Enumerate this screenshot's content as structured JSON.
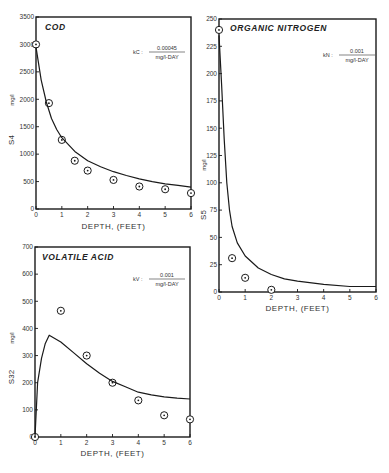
{
  "chart_data": [
    {
      "type": "line",
      "title": "COD",
      "xlabel": "DEPTH, (FEET)",
      "ylabel": "S4",
      "ylabel_units": "mg/l",
      "rate_constant": {
        "symbol": "kC",
        "numerator": "0.00045",
        "denominator": "mg/l-DAY"
      },
      "xlim": [
        0,
        6
      ],
      "ylim": [
        0,
        3500
      ],
      "xticks": [
        0,
        1,
        2,
        3,
        4,
        5,
        6
      ],
      "yticks": [
        0,
        500,
        1000,
        1500,
        2000,
        2500,
        3000,
        3500
      ],
      "grid": false,
      "series": [
        {
          "name": "observed",
          "kind": "scatter",
          "x": [
            0,
            0.5,
            1,
            1.5,
            2,
            3,
            4,
            5,
            6
          ],
          "y": [
            3000,
            1930,
            1260,
            880,
            700,
            530,
            410,
            360,
            290
          ]
        },
        {
          "name": "model",
          "kind": "line",
          "x": [
            0,
            0.2,
            0.4,
            0.6,
            0.8,
            1,
            1.5,
            2,
            2.5,
            3,
            3.5,
            4,
            4.5,
            5,
            5.5,
            6
          ],
          "y": [
            2950,
            2350,
            1950,
            1650,
            1450,
            1300,
            1050,
            880,
            770,
            680,
            610,
            550,
            500,
            460,
            430,
            400
          ]
        }
      ]
    },
    {
      "type": "line",
      "title": "ORGANIC NITROGEN",
      "xlabel": "DEPTH, (FEET)",
      "ylabel": "S5",
      "ylabel_units": "mg/l",
      "rate_constant": {
        "symbol": "kN",
        "numerator": "0.001",
        "denominator": "mg/l-DAY"
      },
      "xlim": [
        0,
        6
      ],
      "ylim": [
        0,
        250
      ],
      "xticks": [
        0,
        1,
        2,
        3,
        4,
        5,
        6
      ],
      "yticks": [
        0,
        25,
        50,
        75,
        100,
        125,
        150,
        175,
        200,
        225,
        250
      ],
      "grid": false,
      "series": [
        {
          "name": "observed",
          "kind": "scatter",
          "x": [
            0,
            0.5,
            1,
            2
          ],
          "y": [
            240,
            31,
            13,
            2
          ]
        },
        {
          "name": "model",
          "kind": "line",
          "x": [
            0,
            0.1,
            0.2,
            0.3,
            0.4,
            0.5,
            0.7,
            1,
            1.5,
            2,
            2.5,
            3,
            4,
            5,
            6
          ],
          "y": [
            235,
            190,
            140,
            100,
            75,
            60,
            45,
            33,
            22,
            16,
            12,
            10,
            7,
            5,
            5
          ]
        }
      ]
    },
    {
      "type": "line",
      "title": "VOLATILE ACID",
      "xlabel": "DEPTH, (FEET)",
      "ylabel": "S32",
      "ylabel_units": "mg/l",
      "rate_constant": {
        "symbol": "kV",
        "numerator": "0.001",
        "denominator": "mg/l-DAY"
      },
      "xlim": [
        0,
        6
      ],
      "ylim": [
        0,
        700
      ],
      "xticks": [
        0,
        1,
        2,
        3,
        4,
        5,
        6
      ],
      "yticks": [
        0,
        100,
        200,
        300,
        400,
        500,
        600,
        700
      ],
      "grid": false,
      "series": [
        {
          "name": "observed",
          "kind": "scatter",
          "x": [
            0,
            1,
            2,
            3,
            4,
            5,
            6
          ],
          "y": [
            0,
            465,
            300,
            200,
            135,
            80,
            65
          ]
        },
        {
          "name": "model",
          "kind": "line",
          "x": [
            0,
            0.1,
            0.25,
            0.4,
            0.55,
            1,
            1.5,
            2,
            2.5,
            3,
            3.5,
            4,
            4.5,
            5,
            5.5,
            6
          ],
          "y": [
            0,
            200,
            290,
            345,
            375,
            350,
            310,
            270,
            235,
            205,
            185,
            165,
            155,
            148,
            143,
            140
          ]
        }
      ]
    }
  ]
}
